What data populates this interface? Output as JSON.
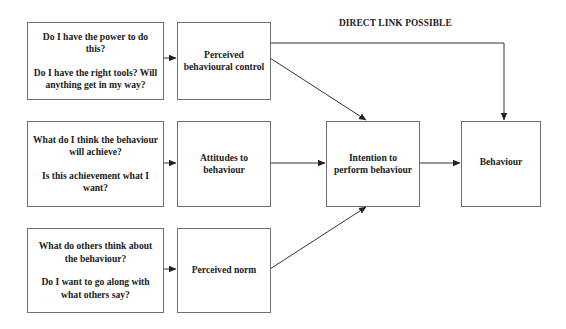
{
  "diagram": {
    "type": "flow",
    "direct_link_label": "DIRECT LINK POSSIBLE",
    "questions": {
      "control": {
        "lines": [
          "Do I have the power to do this?",
          "Do I have the right tools? Will anything get in my way?"
        ]
      },
      "attitude": {
        "lines": [
          "What do I think the behaviour will achieve?",
          "Is this achievement what I want?"
        ]
      },
      "norm": {
        "lines": [
          "What do others think about the behaviour?",
          "Do I want to go along with what others say?"
        ]
      }
    },
    "factors": {
      "control": "Perceived behavioural control",
      "attitude": "Attitudes to behaviour",
      "norm": "Perceived norm"
    },
    "intention": "Intention to perform behaviour",
    "behaviour": "Behaviour",
    "edges": [
      {
        "from": "control-questions",
        "to": "perceived-behavioural-control"
      },
      {
        "from": "attitude-questions",
        "to": "attitudes-to-behaviour"
      },
      {
        "from": "norm-questions",
        "to": "perceived-norm"
      },
      {
        "from": "perceived-behavioural-control",
        "to": "intention"
      },
      {
        "from": "attitudes-to-behaviour",
        "to": "intention"
      },
      {
        "from": "perceived-norm",
        "to": "intention"
      },
      {
        "from": "intention",
        "to": "behaviour"
      },
      {
        "from": "perceived-behavioural-control",
        "to": "behaviour",
        "label": "DIRECT LINK POSSIBLE"
      }
    ],
    "colors": {
      "line": "#333333",
      "border": "#707070",
      "text": "#222222"
    }
  }
}
